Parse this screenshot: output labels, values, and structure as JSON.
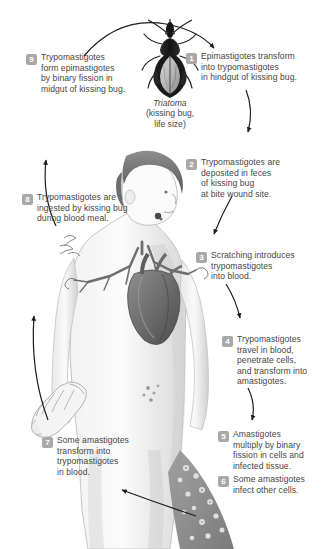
{
  "diagram": {
    "organism_caption": {
      "species": "Triatoma",
      "line2": "(kissing bug,",
      "line3": "life size)"
    },
    "accent_badge_color": "#a8a8a8",
    "text_color": "#454545",
    "background": "#ffffff",
    "steps": [
      {
        "number": "1",
        "text": "Epimastigotes transform\ninto trypomastigotes\nin hindgut of kissing bug."
      },
      {
        "number": "2",
        "text": "Trypomastigotes are\ndeposited in feces\nof kissing bug\nat bite wound site."
      },
      {
        "number": "3",
        "text": "Scratching introduces\ntrypomastigotes\ninto blood."
      },
      {
        "number": "4",
        "text": "Trypomastigotes\ntravel in blood,\npenetrate cells,\nand transform into\namastigotes."
      },
      {
        "number": "5",
        "text": "Amastigotes\nmultiply by binary\nfission in cells and\ninfected tissue."
      },
      {
        "number": "6",
        "text": "Some amastigotes\ninfect other cells."
      },
      {
        "number": "7",
        "text": "Some amastigotes\ntransform into\ntrypomastigotes\nin blood."
      },
      {
        "number": "8",
        "text": "Trypomastigotes are\ningested by kissing bug\nduring blood meal."
      },
      {
        "number": "9",
        "text": "Trypomastigotes\nform epimastigotes\nby binary fission in\nmidgut of kissing bug."
      }
    ],
    "illustrations": [
      {
        "name": "kissing-bug",
        "label": "Triatoma insect, dorsal view"
      },
      {
        "name": "human-figure",
        "label": "Human torso with exposed heart and vessels"
      },
      {
        "name": "heart",
        "label": "Anatomical heart"
      },
      {
        "name": "hand",
        "label": "Hand and forearm"
      },
      {
        "name": "infected-tissue",
        "label": "Infected tissue band with amastigotes"
      }
    ]
  }
}
